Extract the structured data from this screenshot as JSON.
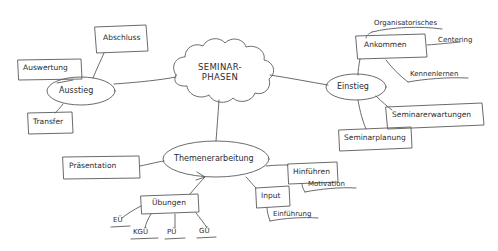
{
  "diagram": {
    "title": "SEMINAR-PHASEN",
    "title_line1": "SEMINAR-",
    "title_line2": "PHASEN",
    "ink_color": "#4a4a4a",
    "background_color": "#ffffff",
    "center": {
      "shape": "cloud",
      "label": "SEMINAR-PHASEN"
    },
    "branches": [
      {
        "id": "ausstieg",
        "shape": "ellipse",
        "label": "Ausstieg",
        "children": [
          {
            "id": "abschluss",
            "shape": "box",
            "label": "Abschluss"
          },
          {
            "id": "auswertung",
            "shape": "box",
            "label": "Auswertung"
          },
          {
            "id": "transfer",
            "shape": "box",
            "label": "Transfer"
          }
        ]
      },
      {
        "id": "einstieg",
        "shape": "ellipse",
        "label": "Einstieg",
        "children": [
          {
            "id": "ankommen",
            "shape": "box",
            "label": "Ankommen",
            "children": [
              {
                "id": "organisatorisches",
                "shape": "underline",
                "label": "Organisatorisches"
              },
              {
                "id": "centering",
                "shape": "underline",
                "label": "Centering"
              },
              {
                "id": "kennenlernen",
                "shape": "underline",
                "label": "Kennenlernen"
              }
            ]
          },
          {
            "id": "seminarerwartungen",
            "shape": "box",
            "label": "Seminarerwartungen"
          },
          {
            "id": "seminarplanung",
            "shape": "box",
            "label": "Seminarplanung"
          }
        ]
      },
      {
        "id": "themenerarbeitung",
        "shape": "ellipse",
        "label": "Themenerarbeitung",
        "children": [
          {
            "id": "praesentation",
            "shape": "box",
            "label": "Präsentation"
          },
          {
            "id": "uebungen",
            "shape": "box",
            "label": "Übungen",
            "children": [
              {
                "id": "eue",
                "shape": "underline",
                "label": "EÜ"
              },
              {
                "id": "kgue",
                "shape": "underline",
                "label": "KGÜ"
              },
              {
                "id": "pue",
                "shape": "underline",
                "label": "PÜ"
              },
              {
                "id": "gue",
                "shape": "underline",
                "label": "GÜ"
              }
            ]
          },
          {
            "id": "hinfuehren",
            "shape": "box",
            "label": "Hinführen",
            "children": [
              {
                "id": "motivation",
                "shape": "underline",
                "label": "Motivation"
              }
            ]
          },
          {
            "id": "input",
            "shape": "box",
            "label": "Input",
            "children": [
              {
                "id": "einfuehrung",
                "shape": "underline",
                "label": "Einführung"
              }
            ]
          }
        ]
      }
    ]
  }
}
